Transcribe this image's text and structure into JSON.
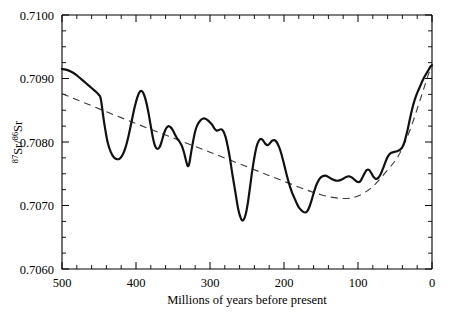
{
  "chart_data": {
    "type": "line",
    "title": "",
    "subtitle": "",
    "xlabel": "Millions of years before present",
    "ylabel": "87Sr/86Sr",
    "ylabel_parts": {
      "sup1": "87",
      "mid1": "Sr/",
      "sup2": "86",
      "mid2": "Sr"
    },
    "xlim": [
      500,
      0
    ],
    "ylim": [
      0.706,
      0.71
    ],
    "x_axis_reversed": true,
    "grid": false,
    "legend": null,
    "x_ticks": [
      500,
      400,
      300,
      200,
      100,
      0
    ],
    "x_tick_labels": [
      "500",
      "400",
      "300",
      "200",
      "100",
      "0"
    ],
    "x_minor_tick_step": 20,
    "y_ticks": [
      0.706,
      0.707,
      0.708,
      0.709,
      0.71
    ],
    "y_tick_labels": [
      "0.7060",
      "0.7070",
      "0.7080",
      "0.7090",
      "0.7100"
    ],
    "y_minor_tick_step": 0.00025,
    "series": [
      {
        "name": "seawater-strontium-curve",
        "style": "solid",
        "color": "#111111",
        "points": [
          [
            500.0,
            0.70915
          ],
          [
            495.0,
            0.70914
          ],
          [
            490.0,
            0.70912
          ],
          [
            485.0,
            0.70909
          ],
          [
            480.0,
            0.70905
          ],
          [
            475.0,
            0.709
          ],
          [
            470.0,
            0.70895
          ],
          [
            465.0,
            0.7089
          ],
          [
            460.0,
            0.70885
          ],
          [
            456.0,
            0.70881
          ],
          [
            453.0,
            0.70878
          ],
          [
            450.0,
            0.70874
          ],
          [
            448.0,
            0.7087
          ],
          [
            446.0,
            0.70856
          ],
          [
            444.0,
            0.70838
          ],
          [
            441.0,
            0.70816
          ],
          [
            438.0,
            0.70798
          ],
          [
            434.0,
            0.70784
          ],
          [
            430.0,
            0.70776
          ],
          [
            426.0,
            0.70773
          ],
          [
            422.0,
            0.70774
          ],
          [
            418.0,
            0.7078
          ],
          [
            414.0,
            0.70792
          ],
          [
            410.0,
            0.7081
          ],
          [
            406.0,
            0.70832
          ],
          [
            402.0,
            0.70854
          ],
          [
            398.0,
            0.70871
          ],
          [
            395.0,
            0.70879
          ],
          [
            392.0,
            0.7088
          ],
          [
            389.0,
            0.70874
          ],
          [
            386.0,
            0.70862
          ],
          [
            383.0,
            0.70845
          ],
          [
            380.0,
            0.70825
          ],
          [
            377.0,
            0.70806
          ],
          [
            374.0,
            0.70793
          ],
          [
            371.0,
            0.70789
          ],
          [
            368.0,
            0.70792
          ],
          [
            365.0,
            0.70802
          ],
          [
            362.0,
            0.70814
          ],
          [
            359.0,
            0.70822
          ],
          [
            356.0,
            0.70825
          ],
          [
            353.0,
            0.70823
          ],
          [
            350.0,
            0.70818
          ],
          [
            347.0,
            0.70811
          ],
          [
            344.0,
            0.70805
          ],
          [
            341.0,
            0.708
          ],
          [
            338.0,
            0.70794
          ],
          [
            335.0,
            0.70783
          ],
          [
            332.0,
            0.70769
          ],
          [
            330.0,
            0.70762
          ],
          [
            328.0,
            0.70766
          ],
          [
            326.0,
            0.7078
          ],
          [
            323.0,
            0.708
          ],
          [
            320.0,
            0.70817
          ],
          [
            317.0,
            0.70827
          ],
          [
            313.0,
            0.70834
          ],
          [
            309.0,
            0.70837
          ],
          [
            305.0,
            0.70836
          ],
          [
            301.0,
            0.70832
          ],
          [
            297.0,
            0.70827
          ],
          [
            294.0,
            0.70821
          ],
          [
            291.0,
            0.70818
          ],
          [
            288.0,
            0.70819
          ],
          [
            285.0,
            0.7082
          ],
          [
            282.0,
            0.70817
          ],
          [
            279.0,
            0.70808
          ],
          [
            276.0,
            0.70793
          ],
          [
            273.0,
            0.70774
          ],
          [
            270.0,
            0.70751
          ],
          [
            266.0,
            0.70723
          ],
          [
            262.0,
            0.70695
          ],
          [
            258.0,
            0.70679
          ],
          [
            255.0,
            0.70677
          ],
          [
            252.0,
            0.70685
          ],
          [
            249.0,
            0.70703
          ],
          [
            246.0,
            0.70728
          ],
          [
            243.0,
            0.70754
          ],
          [
            240.0,
            0.70776
          ],
          [
            237.0,
            0.70793
          ],
          [
            234.0,
            0.70802
          ],
          [
            231.0,
            0.70805
          ],
          [
            228.0,
            0.70802
          ],
          [
            225.0,
            0.70797
          ],
          [
            222.0,
            0.70795
          ],
          [
            219.0,
            0.70798
          ],
          [
            216.0,
            0.70802
          ],
          [
            213.0,
            0.70803
          ],
          [
            210.0,
            0.708
          ],
          [
            207.0,
            0.70793
          ],
          [
            204.0,
            0.70783
          ],
          [
            201.0,
            0.7077
          ],
          [
            198.0,
            0.70756
          ],
          [
            195.0,
            0.70742
          ],
          [
            192.0,
            0.7073
          ],
          [
            189.0,
            0.7072
          ],
          [
            186.0,
            0.70712
          ],
          [
            183.0,
            0.70704
          ],
          [
            180.0,
            0.70697
          ],
          [
            177.0,
            0.70693
          ],
          [
            174.0,
            0.7069
          ],
          [
            171.0,
            0.70689
          ],
          [
            168.0,
            0.70692
          ],
          [
            165.0,
            0.707
          ],
          [
            162.0,
            0.70711
          ],
          [
            159.0,
            0.70723
          ],
          [
            156.0,
            0.70733
          ],
          [
            152.0,
            0.70742
          ],
          [
            148.0,
            0.70746
          ],
          [
            144.0,
            0.70747
          ],
          [
            140.0,
            0.70745
          ],
          [
            136.0,
            0.70742
          ],
          [
            132.0,
            0.7074
          ],
          [
            128.0,
            0.70739
          ],
          [
            124.0,
            0.7074
          ],
          [
            120.0,
            0.70742
          ],
          [
            116.0,
            0.70745
          ],
          [
            112.0,
            0.70746
          ],
          [
            108.0,
            0.70744
          ],
          [
            104.0,
            0.7074
          ],
          [
            100.0,
            0.70737
          ],
          [
            97.0,
            0.70738
          ],
          [
            94.0,
            0.70744
          ],
          [
            91.0,
            0.70751
          ],
          [
            88.0,
            0.70756
          ],
          [
            85.0,
            0.70756
          ],
          [
            82.0,
            0.70751
          ],
          [
            79.0,
            0.70745
          ],
          [
            76.0,
            0.70742
          ],
          [
            73.0,
            0.70743
          ],
          [
            70.0,
            0.70748
          ],
          [
            67.0,
            0.70756
          ],
          [
            64.0,
            0.70765
          ],
          [
            61.0,
            0.70774
          ],
          [
            58.0,
            0.7078
          ],
          [
            55.0,
            0.70783
          ],
          [
            52.0,
            0.70784
          ],
          [
            49.0,
            0.70785
          ],
          [
            46.0,
            0.70786
          ],
          [
            43.0,
            0.70788
          ],
          [
            40.0,
            0.70792
          ],
          [
            37.0,
            0.70801
          ],
          [
            34.0,
            0.70814
          ],
          [
            31.0,
            0.7083
          ],
          [
            28.0,
            0.70846
          ],
          [
            25.0,
            0.7086
          ],
          [
            22.0,
            0.70871
          ],
          [
            19.0,
            0.7088
          ],
          [
            16.0,
            0.70888
          ],
          [
            13.0,
            0.70896
          ],
          [
            10.0,
            0.70903
          ],
          [
            7.0,
            0.70909
          ],
          [
            4.0,
            0.70915
          ],
          [
            2.0,
            0.70919
          ],
          [
            0.0,
            0.70921
          ]
        ]
      },
      {
        "name": "long-term-trend-dashed",
        "style": "dashed",
        "color": "#3a3a3a",
        "points": [
          [
            500.0,
            0.70876
          ],
          [
            400.0,
            0.70829
          ],
          [
            300.0,
            0.70784
          ],
          [
            200.0,
            0.70738
          ],
          [
            150.0,
            0.70717
          ],
          [
            120.0,
            0.70711
          ],
          [
            100.0,
            0.70715
          ],
          [
            80.0,
            0.7073
          ],
          [
            60.0,
            0.70756
          ],
          [
            45.0,
            0.70779
          ],
          [
            30.0,
            0.70818
          ],
          [
            15.0,
            0.7087
          ],
          [
            5.0,
            0.70906
          ],
          [
            0.0,
            0.70919
          ]
        ]
      }
    ]
  }
}
